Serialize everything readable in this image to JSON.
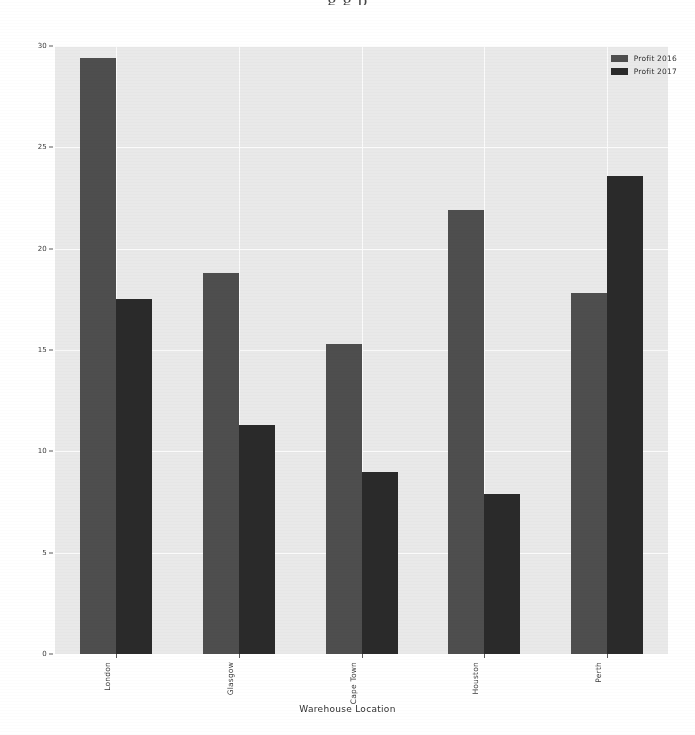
{
  "page": {
    "top_cut_text": "g  g  p"
  },
  "chart_data": {
    "type": "bar",
    "title": "",
    "xlabel": "Warehouse Location",
    "ylabel": "",
    "categories": [
      "London",
      "Glasgow",
      "Cape Town",
      "Houston",
      "Perth"
    ],
    "series": [
      {
        "name": "Profit 2016",
        "color": "#4e4e4e",
        "values": [
          29.4,
          18.8,
          15.3,
          21.9,
          17.8
        ]
      },
      {
        "name": "Profit 2017",
        "color": "#2a2a2a",
        "values": [
          17.5,
          11.3,
          9.0,
          7.9,
          23.6
        ]
      }
    ],
    "ylim": [
      0,
      30
    ],
    "yticks": [
      0,
      5,
      10,
      15,
      20,
      25,
      30
    ],
    "ytick_labels": [
      "0",
      "5",
      "10",
      "15",
      "20",
      "25",
      "30"
    ],
    "grid": true,
    "legend_position": "upper right",
    "plot_background": "#e9e9e9",
    "gridline_color": "#fbfbfb"
  }
}
